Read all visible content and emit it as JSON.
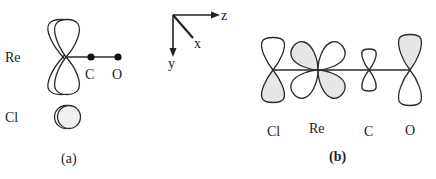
{
  "diagram": {
    "panel_a": {
      "caption": "(a)",
      "labels": {
        "re": "Re",
        "cl": "Cl",
        "c": "C",
        "o": "O"
      },
      "description": "Re d orbital with CO ligand along z; Cl p orbital viewed end-on"
    },
    "axes": {
      "z": "z",
      "x": "x",
      "y": "y"
    },
    "panel_b": {
      "caption": "(b)",
      "labels": [
        "Cl",
        "Re",
        "C",
        "O"
      ],
      "description": "Cl p, Re d, C p and O p orbitals aligned along the Cl–Re–C–O axis"
    },
    "colors": {
      "line": "#2a2a2a",
      "shading": "#e6e6e6",
      "background": "#ffffff"
    }
  }
}
